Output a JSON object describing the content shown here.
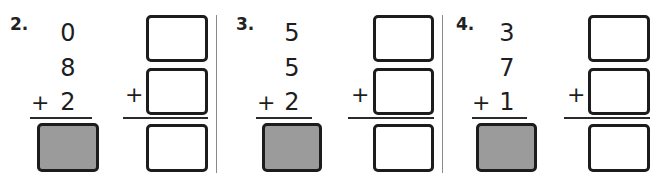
{
  "colors": {
    "text": "#1e1e1e",
    "shaded_box": "#9b9b9b",
    "box_border": "#1c1c1c",
    "divider": "#8a8a8a"
  },
  "problems": [
    {
      "label": "2.",
      "addends": [
        "0",
        "8",
        "2"
      ],
      "operator": "+",
      "answer_box": "shaded-blank",
      "regroup_boxes": [
        "",
        "",
        ""
      ],
      "regroup_operator": "+"
    },
    {
      "label": "3.",
      "addends": [
        "5",
        "5",
        "2"
      ],
      "operator": "+",
      "answer_box": "shaded-blank",
      "regroup_boxes": [
        "",
        "",
        ""
      ],
      "regroup_operator": "+"
    },
    {
      "label": "4.",
      "addends": [
        "3",
        "7",
        "1"
      ],
      "operator": "+",
      "answer_box": "shaded-blank",
      "regroup_boxes": [
        "",
        "",
        ""
      ],
      "regroup_operator": "+"
    }
  ]
}
